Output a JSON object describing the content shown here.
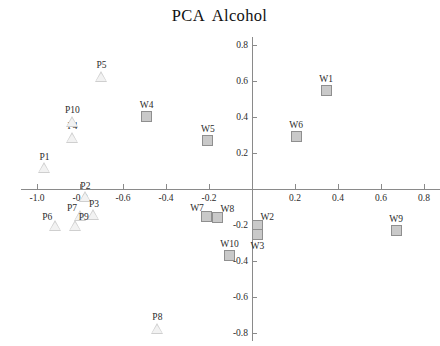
{
  "chart_data": {
    "type": "scatter",
    "title": "PCA  Alcohol",
    "xlabel": "",
    "ylabel": "",
    "xlim": [
      -1.08,
      0.88
    ],
    "ylim": [
      -0.88,
      0.88
    ],
    "xticks": [
      -1.0,
      -0.8,
      -0.6,
      -0.4,
      -0.2,
      0.2,
      0.4,
      0.6,
      0.8
    ],
    "xticklabels": [
      "-1.0",
      "-0.8",
      "-0.6",
      "-0.4",
      "-0.2",
      "0.2",
      "0.4",
      "0.6",
      "0.8"
    ],
    "yticks": [
      0.8,
      0.6,
      0.4,
      0.2,
      -0.2,
      -0.4,
      -0.6,
      -0.8
    ],
    "yticklabels": [
      "0.8",
      "0.6",
      "0.4",
      "0.2",
      "-0.2",
      "-0.4",
      "-0.6",
      "-0.8"
    ],
    "grid": false,
    "legend": "none",
    "axes_style": "crosshair-at-origin",
    "marker_colors": {
      "triangle_fill": "#cfcfcf",
      "triangle_edge": "#b5b5b5",
      "square_fill": "#c9c9c9",
      "square_edge": "#8f8f8f",
      "axis": "#8a8a8a"
    },
    "series": [
      {
        "name": "P",
        "marker": "triangle",
        "points": [
          {
            "label": "P1",
            "x": -0.965,
            "y": 0.115,
            "label_pos": "above"
          },
          {
            "label": "P2",
            "x": -0.775,
            "y": -0.045,
            "label_pos": "above"
          },
          {
            "label": "P3",
            "x": -0.735,
            "y": -0.145,
            "label_pos": "above"
          },
          {
            "label": "P4",
            "x": -0.835,
            "y": 0.285,
            "label_pos": "above"
          },
          {
            "label": "P5",
            "x": -0.7,
            "y": 0.625,
            "label_pos": "above"
          },
          {
            "label": "P6",
            "x": -0.915,
            "y": -0.205,
            "label_pos": "upleft"
          },
          {
            "label": "P7",
            "x": -0.8,
            "y": -0.15,
            "label_pos": "upleft"
          },
          {
            "label": "P8",
            "x": -0.44,
            "y": -0.775,
            "label_pos": "above"
          },
          {
            "label": "P9",
            "x": -0.82,
            "y": -0.205,
            "label_pos": "upright"
          },
          {
            "label": "P10",
            "x": -0.835,
            "y": 0.375,
            "label_pos": "above"
          }
        ]
      },
      {
        "name": "W",
        "marker": "square",
        "points": [
          {
            "label": "W1",
            "x": 0.345,
            "y": 0.55,
            "label_pos": "above"
          },
          {
            "label": "W2",
            "x": 0.025,
            "y": -0.205,
            "label_pos": "upright"
          },
          {
            "label": "W3",
            "x": 0.025,
            "y": -0.255,
            "label_pos": "below"
          },
          {
            "label": "W4",
            "x": -0.49,
            "y": 0.405,
            "label_pos": "above"
          },
          {
            "label": "W5",
            "x": -0.205,
            "y": 0.27,
            "label_pos": "above"
          },
          {
            "label": "W6",
            "x": 0.205,
            "y": 0.29,
            "label_pos": "above"
          },
          {
            "label": "W7",
            "x": -0.21,
            "y": -0.15,
            "label_pos": "upleft"
          },
          {
            "label": "W8",
            "x": -0.16,
            "y": -0.16,
            "label_pos": "upright"
          },
          {
            "label": "W9",
            "x": 0.67,
            "y": -0.23,
            "label_pos": "above"
          },
          {
            "label": "W10",
            "x": -0.105,
            "y": -0.37,
            "label_pos": "above"
          }
        ]
      }
    ]
  }
}
